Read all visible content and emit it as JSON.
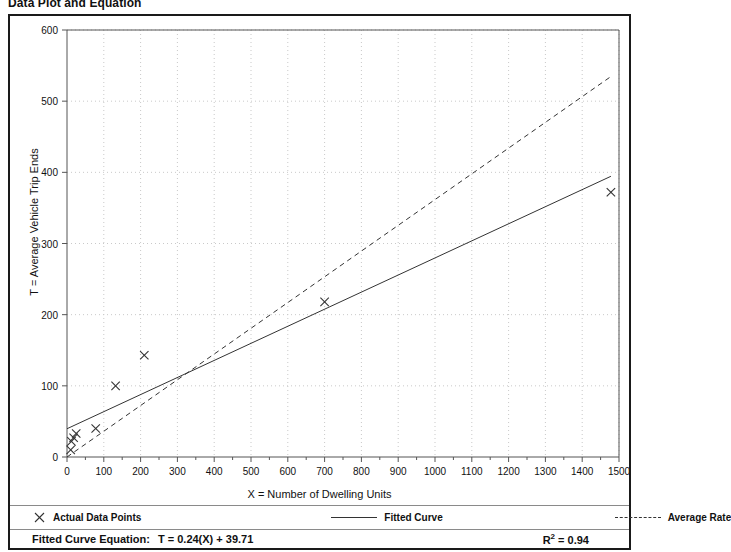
{
  "title": "Data Plot and Equation",
  "axes": {
    "x_title": "X = Number of Dwelling Units",
    "y_title": "T = Average Vehicle Trip Ends"
  },
  "legend": {
    "items": [
      {
        "label": "Actual Data Points",
        "symbol": "x-marker"
      },
      {
        "label": "Fitted Curve",
        "symbol": "solid-line"
      },
      {
        "label": "Average Rate",
        "symbol": "dashed-line"
      }
    ]
  },
  "footer": {
    "equation_label": "Fitted Curve Equation:",
    "equation_value": "T = 0.24(X) + 39.71",
    "rsq_prefix": "R",
    "rsq_exponent": "2",
    "rsq_value": " = 0.94"
  },
  "colors": {
    "frame": "#1a1a1a",
    "grid": "#c9c9c9",
    "axis": "#555555",
    "fitted_curve": "#333333",
    "average_rate": "#333333",
    "marker": "#333333",
    "text": "#111111"
  },
  "chart_data": {
    "type": "scatter",
    "title": "Data Plot and Equation",
    "xlabel": "X = Number of Dwelling Units",
    "ylabel": "T = Average Vehicle Trip Ends",
    "xlim": [
      0,
      1500
    ],
    "ylim": [
      0,
      600
    ],
    "xticks": [
      0,
      100,
      200,
      300,
      400,
      500,
      600,
      700,
      800,
      900,
      1000,
      1100,
      1200,
      1300,
      1400,
      1500
    ],
    "yticks": [
      0,
      100,
      200,
      300,
      400,
      500,
      600
    ],
    "x_minor_tick_step": 50,
    "grid": true,
    "grid_style": "dotted",
    "legend_position": "below-plot",
    "series": [
      {
        "name": "Actual Data Points",
        "type": "scatter",
        "marker": "x",
        "points": [
          {
            "x": 10,
            "y": 10
          },
          {
            "x": 12,
            "y": 22
          },
          {
            "x": 18,
            "y": 27
          },
          {
            "x": 25,
            "y": 33
          },
          {
            "x": 78,
            "y": 40
          },
          {
            "x": 132,
            "y": 100
          },
          {
            "x": 210,
            "y": 143
          },
          {
            "x": 700,
            "y": 218
          },
          {
            "x": 1478,
            "y": 372
          }
        ]
      },
      {
        "name": "Fitted Curve",
        "type": "line",
        "style": "solid",
        "equation": "T = 0.24(X) + 39.71",
        "slope": 0.24,
        "intercept": 39.71,
        "endpoints": [
          {
            "x": 0,
            "y": 39.71
          },
          {
            "x": 1478,
            "y": 394.43
          }
        ]
      },
      {
        "name": "Average Rate",
        "type": "line",
        "style": "dashed",
        "slope": 0.3617,
        "intercept": 0,
        "endpoints": [
          {
            "x": 0,
            "y": 0
          },
          {
            "x": 1478,
            "y": 534.6
          }
        ]
      }
    ],
    "annotations": [
      {
        "text": "Fitted Curve Equation:  T = 0.24(X) + 39.71",
        "position": "footer-left"
      },
      {
        "text": "R² = 0.94",
        "position": "footer-right"
      }
    ],
    "r_squared": 0.94
  }
}
